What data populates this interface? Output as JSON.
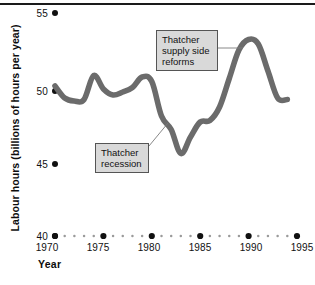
{
  "chart_data": {
    "type": "line",
    "title": "",
    "xlabel": "Year",
    "ylabel": "Labour hours (billions of hours per year)",
    "xlim": [
      1970,
      1995
    ],
    "ylim": [
      40,
      55
    ],
    "yticks": [
      40,
      45,
      50,
      55
    ],
    "xticks": [
      1970,
      1975,
      1980,
      1985,
      1990,
      1995
    ],
    "grid": false,
    "legend": "none",
    "series": [
      {
        "name": "Labour hours",
        "color": "#6b6b6b",
        "x": [
          1970,
          1971,
          1972,
          1973,
          1974,
          1975,
          1976,
          1977,
          1978,
          1979,
          1980,
          1981,
          1982,
          1983,
          1984,
          1985,
          1986,
          1987,
          1988,
          1989,
          1990,
          1991,
          1992,
          1993,
          1994
        ],
        "values": [
          50.0,
          49.2,
          49.0,
          49.1,
          50.7,
          49.8,
          49.4,
          49.6,
          49.9,
          50.6,
          50.3,
          48.0,
          47.1,
          45.5,
          46.6,
          47.6,
          47.7,
          48.6,
          50.5,
          52.4,
          53.1,
          52.8,
          51.0,
          49.2,
          49.1
        ]
      }
    ],
    "annotations": [
      {
        "name": "thatcher-supply-side-reforms",
        "text": "Thatcher supply side reforms",
        "lines": [
          "Thatcher",
          "supply side",
          "reforms"
        ],
        "points_to_year": 1990,
        "points_to_value": 53.1
      },
      {
        "name": "thatcher-recession",
        "text": "Thatcher recession",
        "lines": [
          "Thatcher",
          "recession"
        ],
        "points_to_year": 1981,
        "points_to_value": 48.0
      }
    ]
  },
  "axis": {
    "y_title": "Labour hours (billions of hours per year)",
    "x_title": "Year",
    "y_labels": [
      "55",
      "50",
      "45",
      "40"
    ],
    "x_labels": [
      "1970",
      "1975",
      "1980",
      "1985",
      "1990",
      "1995"
    ]
  },
  "annotations": {
    "reforms": {
      "line1": "Thatcher",
      "line2": "supply side",
      "line3": "reforms"
    },
    "recession": {
      "line1": "Thatcher",
      "line2": "recession"
    }
  },
  "colors": {
    "line": "#6b6b6b",
    "text": "#111111",
    "annotation_fill": "#d9d9d9",
    "annotation_border": "#555555",
    "rule": "#1a1a1a"
  }
}
